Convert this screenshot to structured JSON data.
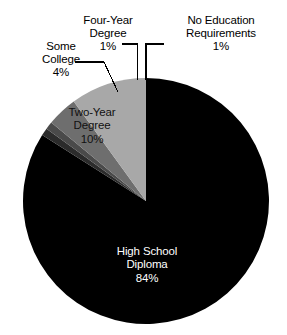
{
  "chart_data": {
    "type": "pie",
    "title": "",
    "subtitle": "",
    "xlabel": "",
    "ylabel": "",
    "legend_position": "none",
    "grid": false,
    "label_style": "callout-with-leader-lines",
    "start_angle_deg": 0,
    "direction": "clockwise",
    "units": "percent",
    "categories": [
      "High School Diploma",
      "No Education Requirements",
      "Four-Year Degree",
      "Some College",
      "Two-Year Degree"
    ],
    "values": [
      84,
      1,
      1,
      4,
      10
    ],
    "slices": [
      {
        "name": "high-school-diploma",
        "label": "High School",
        "label_line2": "Diploma",
        "value": 84,
        "value_text": "84%",
        "color": "#000000",
        "text_color": "#ffffff",
        "label_placement": "inside"
      },
      {
        "name": "no-education-requirements",
        "label": "No Education",
        "label_line2": "Requirements",
        "value": 1,
        "value_text": "1%",
        "color": "#2b2b2b",
        "text_color": "#000000",
        "label_placement": "outside-leader"
      },
      {
        "name": "four-year-degree",
        "label": "Four-Year",
        "label_line2": "Degree",
        "value": 1,
        "value_text": "1%",
        "color": "#4a4a4a",
        "text_color": "#000000",
        "label_placement": "outside-leader"
      },
      {
        "name": "some-college",
        "label": "Some",
        "label_line2": "College",
        "value": 4,
        "value_text": "4%",
        "color": "#6e6e6e",
        "text_color": "#000000",
        "label_placement": "outside-leader"
      },
      {
        "name": "two-year-degree",
        "label": "Two-Year",
        "label_line2": "Degree",
        "value": 10,
        "value_text": "10%",
        "color": "#a8a8a8",
        "text_color": "#111111",
        "label_placement": "inside"
      }
    ]
  },
  "colors": {
    "background": "#ffffff",
    "black_slice": "#000000",
    "light_gray_slice": "#a8a8a8",
    "mid_gray_slice": "#6e6e6e",
    "dark_gray_slice": "#4a4a4a",
    "darkest_gray_slice": "#2b2b2b",
    "leader_line": "#000000",
    "text": "#000000",
    "inverse_text": "#ffffff"
  }
}
